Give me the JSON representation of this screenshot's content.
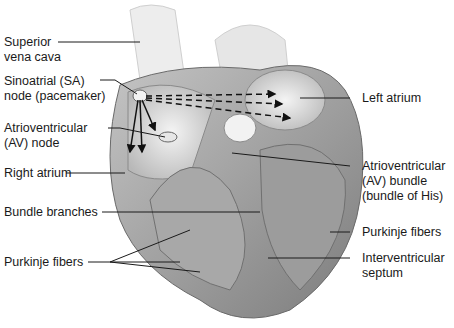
{
  "diagram": {
    "labels_left": [
      {
        "id": "superior-vena-cava",
        "line1": "Superior",
        "line2": "vena cava"
      },
      {
        "id": "sa-node",
        "line1": "Sinoatrial (SA)",
        "line2": "node (pacemaker)"
      },
      {
        "id": "av-node",
        "line1": "Atrioventricular",
        "line2": "(AV) node"
      },
      {
        "id": "right-atrium",
        "line1": "Right atrium"
      },
      {
        "id": "bundle-branches",
        "line1": "Bundle branches"
      },
      {
        "id": "purkinje-fibers-left",
        "line1": "Purkinje fibers"
      }
    ],
    "labels_right": [
      {
        "id": "left-atrium",
        "line1": "Left atrium"
      },
      {
        "id": "av-bundle",
        "line1": "Atrioventricular",
        "line2": "(AV) bundle",
        "line3": "(bundle of His)"
      },
      {
        "id": "purkinje-fibers-right",
        "line1": "Purkinje fibers"
      },
      {
        "id": "interventricular-septum",
        "line1": "Interventricular",
        "line2": "septum"
      }
    ],
    "colors": {
      "background": "#ffffff",
      "leader_line": "#1a1a1a",
      "heart_tissue": "#9a9a9a",
      "chamber": "#e2e2e2"
    }
  }
}
